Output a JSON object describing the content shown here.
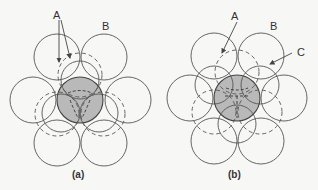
{
  "figure": {
    "panels": [
      {
        "id": "a",
        "caption": "(a)",
        "labels": {
          "A": "A",
          "B": "B"
        }
      },
      {
        "id": "b",
        "caption": "(b)",
        "labels": {
          "A": "A",
          "B": "B",
          "C": "C"
        }
      }
    ],
    "colors": {
      "stroke": "#555555",
      "shaded_sphere": "#b9b9b9",
      "background": "#f7f7f5"
    }
  }
}
